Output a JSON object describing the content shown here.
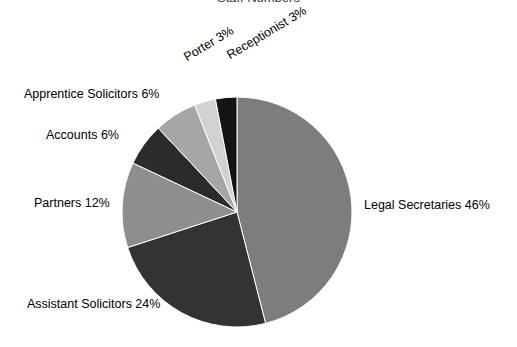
{
  "chart_data": {
    "type": "pie",
    "title": "Staff Numbers",
    "xlabel": "",
    "ylabel": "",
    "legend_position": "none",
    "grid": false,
    "start_angle_deg": 0,
    "direction": "clockwise",
    "categories": [
      "Legal Secretaries",
      "Assistant Solicitors",
      "Partners",
      "Accounts",
      "Apprentice Solicitors",
      "Porter",
      "Receptionist"
    ],
    "values": [
      46,
      24,
      12,
      6,
      6,
      3,
      3
    ],
    "units": "%",
    "slices": [
      {
        "name": "Legal Secretaries",
        "value": 46,
        "label": "Legal Secretaries 46%",
        "color": "#7d7d7d",
        "start_deg": 0,
        "end_deg": 165.6
      },
      {
        "name": "Assistant Solicitors",
        "value": 24,
        "label": "Assistant Solicitors 24%",
        "color": "#333333",
        "start_deg": 165.6,
        "end_deg": 252.0
      },
      {
        "name": "Partners",
        "value": 12,
        "label": "Partners 12%",
        "color": "#8e8e8e",
        "start_deg": 252.0,
        "end_deg": 295.2
      },
      {
        "name": "Accounts",
        "value": 6,
        "label": "Accounts 6%",
        "color": "#2b2b2b",
        "start_deg": 295.2,
        "end_deg": 316.8
      },
      {
        "name": "Apprentice Solicitors",
        "value": 6,
        "label": "Apprentice Solicitors 6%",
        "color": "#a6a6a6",
        "start_deg": 316.8,
        "end_deg": 338.4
      },
      {
        "name": "Porter",
        "value": 3,
        "label": "Porter 3%",
        "color": "#d2d2d2",
        "start_deg": 338.4,
        "end_deg": 349.2
      },
      {
        "name": "Receptionist",
        "value": 3,
        "label": "Receptionist 3%",
        "color": "#141414",
        "start_deg": 349.2,
        "end_deg": 360.0
      }
    ],
    "geometry": {
      "center_x": 237,
      "center_y": 212,
      "radius": 115
    }
  },
  "labels": {
    "legal_secretaries": "Legal Secretaries 46%",
    "assistant_solicitors": "Assistant Solicitors 24%",
    "partners": "Partners 12%",
    "accounts": "Accounts 6%",
    "apprentice_solicitors": "Apprentice Solicitors 6%",
    "porter": "Porter 3%",
    "receptionist": "Receptionist 3%"
  },
  "title": "Staff Numbers"
}
